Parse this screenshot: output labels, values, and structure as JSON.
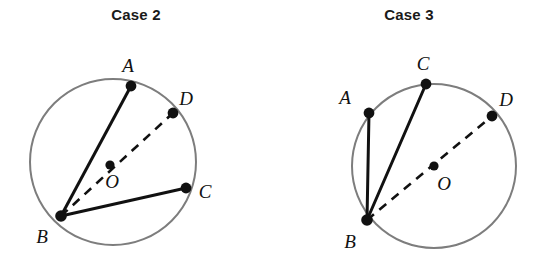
{
  "figure": {
    "background_color": "#ffffff",
    "circle_stroke": "#7d7d7d",
    "chord_stroke": "#111111",
    "dash_stroke": "#111111",
    "point_fill": "#111111",
    "label_color": "#111111"
  },
  "cases": [
    {
      "title": "Case 2",
      "circle": {
        "cx": 113,
        "cy": 162,
        "r": 83
      },
      "center_point": {
        "label": "O",
        "x": 110,
        "y": 165,
        "label_x": 112,
        "label_y": 188
      },
      "points": [
        {
          "label": "A",
          "x": 131,
          "y": 86,
          "label_x": 128,
          "label_y": 72
        },
        {
          "label": "B",
          "x": 61,
          "y": 216,
          "label_x": 42,
          "label_y": 243
        },
        {
          "label": "C",
          "x": 186,
          "y": 188,
          "label_x": 205,
          "label_y": 198
        },
        {
          "label": "D",
          "x": 173,
          "y": 113,
          "label_x": 186,
          "label_y": 105
        }
      ],
      "solid_segments": [
        {
          "from": "B",
          "to": "A"
        },
        {
          "from": "B",
          "to": "C"
        }
      ],
      "dashed_segments": [
        {
          "from": "B",
          "to": "D"
        }
      ]
    },
    {
      "title": "Case 3",
      "circle": {
        "cx": 434,
        "cy": 166,
        "r": 82
      },
      "center_point": {
        "label": "O",
        "x": 434,
        "y": 166,
        "label_x": 444,
        "label_y": 190
      },
      "points": [
        {
          "label": "A",
          "x": 369,
          "y": 113,
          "label_x": 345,
          "label_y": 104
        },
        {
          "label": "B",
          "x": 367,
          "y": 220,
          "label_x": 350,
          "label_y": 248
        },
        {
          "label": "C",
          "x": 426,
          "y": 84,
          "label_x": 423,
          "label_y": 70
        },
        {
          "label": "D",
          "x": 492,
          "y": 116,
          "label_x": 506,
          "label_y": 106
        }
      ],
      "solid_segments": [
        {
          "from": "B",
          "to": "A"
        },
        {
          "from": "B",
          "to": "C"
        }
      ],
      "dashed_segments": [
        {
          "from": "B",
          "to": "D"
        }
      ]
    }
  ]
}
